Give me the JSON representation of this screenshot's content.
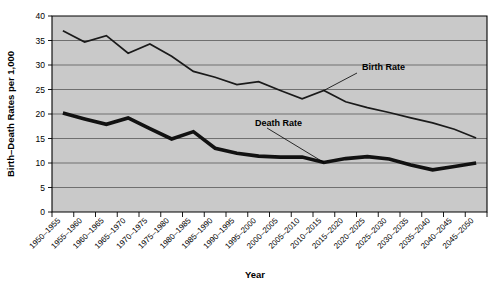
{
  "chart_data": {
    "type": "line",
    "title": "",
    "xlabel": "Year",
    "ylabel": "Birth–Death Rates per 1,000",
    "ylim": [
      0,
      40
    ],
    "ytick_step": 5,
    "yticks": [
      "0",
      "5",
      "10",
      "15",
      "20",
      "25",
      "30",
      "35",
      "40"
    ],
    "grid": true,
    "grid_axis": "y",
    "legend": "none",
    "plot_background": "#c9c9c9",
    "categories": [
      "1950–1955",
      "1955–1960",
      "1960–1965",
      "1965–1970",
      "1970–1975",
      "1975–1980",
      "1980–1985",
      "1985–1990",
      "1990–1995",
      "1995–2000",
      "2000–2005",
      "2005–2010",
      "2010–2015",
      "2015–2020",
      "2020–2025",
      "2025–2030",
      "2030–2035",
      "2035–2040",
      "2040–2045",
      "2045–2050"
    ],
    "series": [
      {
        "name": "Birth Rate",
        "color": "#1a1a1a",
        "values": [
          37.0,
          34.7,
          36.0,
          32.4,
          34.3,
          31.8,
          28.7,
          27.5,
          26.0,
          26.6,
          24.8,
          23.1,
          24.8,
          22.5,
          21.3,
          20.3,
          19.2,
          18.2,
          16.9,
          15.1
        ]
      },
      {
        "name": "Death Rate",
        "color": "#111111",
        "values": [
          20.2,
          19.0,
          17.9,
          19.2,
          17.0,
          14.9,
          16.4,
          13.0,
          12.0,
          11.4,
          11.2,
          11.2,
          10.1,
          10.9,
          11.3,
          10.8,
          9.6,
          8.6,
          9.3,
          10.0
        ]
      }
    ],
    "annotations": [
      {
        "label": "Birth Rate",
        "target_category": "2010–2015",
        "target_value": 24.8
      },
      {
        "label": "Death Rate",
        "target_category": "2010–2015",
        "target_value": 10.1
      }
    ]
  }
}
